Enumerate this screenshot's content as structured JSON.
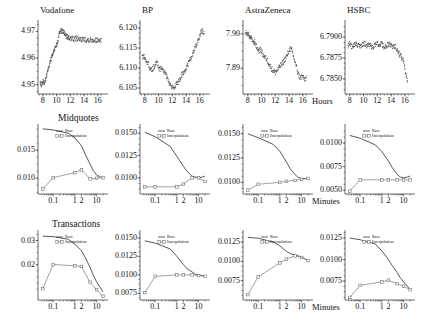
{
  "figure": {
    "rows": [
      {
        "row_title": "",
        "unit_label": "Hours"
      },
      {
        "row_title": "Midquotes",
        "unit_label": "Minutes"
      },
      {
        "row_title": "Transactions",
        "unit_label": "Minutes"
      }
    ],
    "legend": {
      "raw": "Raw",
      "interpolation": "Interpolation"
    }
  },
  "chart_data": [
    {
      "type": "line",
      "title": "Vodafone",
      "xlabel": "Hours",
      "ylabel": "",
      "xlim": [
        7.3,
        16.9
      ],
      "ylim": [
        4.9465,
        4.9735
      ],
      "xticks": [
        8,
        10,
        12,
        14,
        16
      ],
      "xticklabels": [
        "8",
        "10",
        "12",
        "14",
        "16"
      ],
      "yticks": [
        4.95,
        4.96,
        4.97
      ],
      "yticklabels": [
        "4.95",
        "4.96",
        "4.97"
      ],
      "grid": false,
      "series": [
        {
          "name": "price",
          "x": [
            7.6,
            7.8,
            8.0,
            8.2,
            8.4,
            8.6,
            8.8,
            9.0,
            9.2,
            9.4,
            9.6,
            9.8,
            10.0,
            10.2,
            10.4,
            10.6,
            10.8,
            11.0,
            11.2,
            11.4,
            11.6,
            11.8,
            12.0,
            12.3,
            12.6,
            12.9,
            13.2,
            13.5,
            13.8,
            14.1,
            14.4,
            14.7,
            15.0,
            15.3,
            15.6,
            15.9,
            16.2,
            16.5
          ],
          "y": [
            4.9505,
            4.95,
            4.9512,
            4.9508,
            4.9523,
            4.954,
            4.9565,
            4.958,
            4.9598,
            4.9612,
            4.9628,
            4.964,
            4.9652,
            4.9668,
            4.97,
            4.9703,
            4.9701,
            4.9698,
            4.969,
            4.9682,
            4.9678,
            4.9675,
            4.9674,
            4.9673,
            4.9672,
            4.9672,
            4.9671,
            4.9671,
            4.967,
            4.967,
            4.9669,
            4.9669,
            4.9669,
            4.9668,
            4.9668,
            4.9668,
            4.9668,
            4.9668
          ]
        }
      ]
    },
    {
      "type": "line",
      "title": "BP",
      "xlabel": "Hours",
      "ylabel": "",
      "xlim": [
        7.3,
        16.9
      ],
      "ylim": [
        6.1035,
        6.1215
      ],
      "xticks": [
        8,
        10,
        12,
        14,
        16
      ],
      "xticklabels": [
        "8",
        "10",
        "12",
        "14",
        "16"
      ],
      "yticks": [
        6.105,
        6.11,
        6.115,
        6.12
      ],
      "yticklabels": [
        "6.105",
        "6.110",
        "6.115",
        "6.120"
      ],
      "grid": false,
      "series": [
        {
          "name": "price",
          "x": [
            7.6,
            7.9,
            8.2,
            8.5,
            8.8,
            9.1,
            9.4,
            9.7,
            10.0,
            10.3,
            10.6,
            10.9,
            11.2,
            11.5,
            11.8,
            12.1,
            12.4,
            12.7,
            13.0,
            13.3,
            13.6,
            13.9,
            14.2,
            14.5,
            14.8,
            15.1,
            15.4,
            15.7,
            16.0,
            16.3,
            16.6
          ],
          "y": [
            6.1125,
            6.113,
            6.1118,
            6.111,
            6.1095,
            6.1098,
            6.1105,
            6.1118,
            6.11,
            6.1098,
            6.1096,
            6.109,
            6.1078,
            6.1062,
            6.1055,
            6.1052,
            6.1055,
            6.1062,
            6.107,
            6.1082,
            6.1088,
            6.1095,
            6.1105,
            6.1118,
            6.113,
            6.1142,
            6.1155,
            6.1168,
            6.1182,
            6.1195,
            6.1188
          ]
        }
      ]
    },
    {
      "type": "line",
      "title": "AstraZeneca",
      "xlabel": "Hours",
      "ylabel": "",
      "xlim": [
        7.3,
        16.9
      ],
      "ylim": [
        7.8825,
        7.9035
      ],
      "xticks": [
        8,
        10,
        12,
        14,
        16
      ],
      "xticklabels": [
        "8",
        "10",
        "12",
        "14",
        "16"
      ],
      "yticks": [
        7.89,
        7.9
      ],
      "yticklabels": [
        "7.89",
        "7.90"
      ],
      "grid": false,
      "series": [
        {
          "name": "price",
          "x": [
            7.6,
            7.9,
            8.1,
            8.3,
            8.5,
            8.8,
            9.0,
            9.3,
            9.6,
            9.9,
            10.2,
            10.5,
            10.8,
            11.1,
            11.4,
            11.7,
            12.0,
            12.3,
            12.6,
            12.9,
            13.2,
            13.5,
            13.8,
            14.1,
            14.4,
            14.7,
            15.0,
            15.3,
            15.6,
            15.9,
            16.2,
            16.5
          ],
          "y": [
            7.9005,
            7.8998,
            7.9002,
            7.8985,
            7.899,
            7.8972,
            7.8978,
            7.896,
            7.8952,
            7.8955,
            7.894,
            7.8932,
            7.8925,
            7.8912,
            7.89,
            7.8893,
            7.8888,
            7.8895,
            7.8905,
            7.8912,
            7.892,
            7.893,
            7.8942,
            7.8958,
            7.8952,
            7.893,
            7.8908,
            7.8885,
            7.8872,
            7.8878,
            7.8868,
            7.8872
          ]
        }
      ]
    },
    {
      "type": "line",
      "title": "HSBC",
      "xlabel": "Hours",
      "ylabel": "",
      "xlim": [
        7.3,
        16.9
      ],
      "ylim": [
        6.7832,
        6.7918
      ],
      "xticks": [
        8,
        10,
        12,
        14,
        16
      ],
      "xticklabels": [
        "8",
        "10",
        "12",
        "14",
        "16"
      ],
      "yticks": [
        6.785,
        6.7875,
        6.79
      ],
      "yticklabels": [
        "6.7850",
        "6.7875",
        "6.7900"
      ],
      "grid": false,
      "series": [
        {
          "name": "price",
          "x": [
            7.7,
            8.0,
            8.3,
            8.6,
            8.9,
            9.2,
            9.5,
            9.8,
            10.1,
            10.4,
            10.7,
            11.0,
            11.3,
            11.6,
            11.9,
            12.2,
            12.5,
            12.8,
            13.1,
            13.4,
            13.7,
            14.0,
            14.3,
            14.6,
            14.9,
            15.2,
            15.5,
            15.8,
            16.1,
            16.4
          ],
          "y": [
            6.789,
            6.7893,
            6.7888,
            6.789,
            6.7892,
            6.789,
            6.7888,
            6.789,
            6.7893,
            6.789,
            6.7892,
            6.789,
            6.7888,
            6.789,
            6.7892,
            6.789,
            6.7893,
            6.789,
            6.7888,
            6.789,
            6.7892,
            6.789,
            6.7888,
            6.789,
            6.7885,
            6.788,
            6.7876,
            6.7872,
            6.7858,
            6.7845
          ]
        }
      ]
    },
    {
      "type": "line",
      "title": "",
      "row": "Midquotes",
      "stock": "Vodafone",
      "xlabel": "Minutes",
      "xscale": "log",
      "xlim": [
        0.02,
        22
      ],
      "ylim": [
        0.0072,
        0.0193
      ],
      "xticks": [
        0.1,
        1,
        2,
        10
      ],
      "xticklabels": [
        "0.1",
        "1",
        "2",
        "10"
      ],
      "yticks": [
        0.01,
        0.015
      ],
      "yticklabels": [
        "0.010",
        "0.015"
      ],
      "grid": false,
      "series": [
        {
          "name": "Raw",
          "x": [
            0.0333,
            0.1,
            0.5,
            1,
            2,
            3,
            5,
            7,
            10,
            15,
            20
          ],
          "y": [
            0.0188,
            0.0186,
            0.018,
            0.0172,
            0.0158,
            0.0143,
            0.0125,
            0.0114,
            0.0106,
            0.0102,
            0.0101
          ]
        },
        {
          "name": "Interpolation",
          "x": [
            0.0333,
            0.1,
            1,
            2,
            5,
            10,
            20
          ],
          "y": [
            0.0081,
            0.0101,
            0.011,
            0.0115,
            0.0099,
            0.01,
            0.0101
          ]
        }
      ]
    },
    {
      "type": "line",
      "title": "",
      "row": "Midquotes",
      "stock": "BP",
      "xlabel": "Minutes",
      "xscale": "log",
      "xlim": [
        0.02,
        22
      ],
      "ylim": [
        0.0082,
        0.0158
      ],
      "xticks": [
        0.1,
        1,
        2,
        10
      ],
      "xticklabels": [
        "0.1",
        "1",
        "2",
        "10"
      ],
      "yticks": [
        0.01,
        0.0125,
        0.015
      ],
      "yticklabels": [
        "0.0100",
        "0.0125",
        "0.0150"
      ],
      "grid": false,
      "series": [
        {
          "name": "Raw",
          "x": [
            0.0333,
            0.1,
            0.5,
            1,
            2,
            3,
            5,
            7,
            10,
            15,
            20
          ],
          "y": [
            0.0151,
            0.0146,
            0.0135,
            0.0124,
            0.0113,
            0.0107,
            0.0102,
            0.0101,
            0.01,
            0.0101,
            0.0102
          ]
        },
        {
          "name": "Interpolation",
          "x": [
            0.0333,
            0.1,
            1,
            2,
            5,
            10,
            20
          ],
          "y": [
            0.009,
            0.009,
            0.009,
            0.0093,
            0.01,
            0.01,
            0.0096
          ]
        }
      ]
    },
    {
      "type": "line",
      "title": "",
      "row": "Midquotes",
      "stock": "AstraZeneca",
      "xlabel": "Minutes",
      "xscale": "log",
      "xlim": [
        0.02,
        22
      ],
      "ylim": [
        0.0088,
        0.0158
      ],
      "xticks": [
        0.1,
        1,
        2,
        10
      ],
      "xticklabels": [
        "0.1",
        "1",
        "2",
        "10"
      ],
      "yticks": [
        0.01,
        0.0125,
        0.015
      ],
      "yticklabels": [
        "0.0100",
        "0.0125",
        "0.0150"
      ],
      "grid": false,
      "series": [
        {
          "name": "Raw",
          "x": [
            0.0333,
            0.1,
            0.5,
            1,
            2,
            3,
            5,
            7,
            10,
            15,
            20
          ],
          "y": [
            0.015,
            0.0146,
            0.0139,
            0.0132,
            0.0121,
            0.0114,
            0.0108,
            0.0105,
            0.0104,
            0.0104,
            0.0105
          ]
        },
        {
          "name": "Interpolation",
          "x": [
            0.0333,
            0.1,
            1,
            2,
            5,
            10,
            20
          ],
          "y": [
            0.0092,
            0.0098,
            0.01,
            0.0101,
            0.0102,
            0.0103,
            0.0104
          ]
        }
      ]
    },
    {
      "type": "line",
      "title": "",
      "row": "Midquotes",
      "stock": "HSBC",
      "xlabel": "Minutes",
      "xscale": "log",
      "xlim": [
        0.02,
        22
      ],
      "ylim": [
        0.0046,
        0.0118
      ],
      "xticks": [
        0.1,
        1,
        2,
        10
      ],
      "xticklabels": [
        "0.1",
        "1",
        "2",
        "10"
      ],
      "yticks": [
        0.005,
        0.0075,
        0.01
      ],
      "yticklabels": [
        "0.0050",
        "0.0075",
        "0.0100"
      ],
      "grid": false,
      "series": [
        {
          "name": "Raw",
          "x": [
            0.0333,
            0.1,
            0.5,
            1,
            2,
            3,
            5,
            7,
            10,
            15,
            20
          ],
          "y": [
            0.0108,
            0.0105,
            0.0098,
            0.0091,
            0.0081,
            0.0074,
            0.0067,
            0.0064,
            0.0063,
            0.0064,
            0.0065
          ]
        },
        {
          "name": "Interpolation",
          "x": [
            0.0333,
            0.1,
            1,
            2,
            5,
            10,
            20
          ],
          "y": [
            0.0049,
            0.0061,
            0.0061,
            0.0061,
            0.0061,
            0.0061,
            0.0061
          ]
        }
      ]
    },
    {
      "type": "line",
      "title": "",
      "row": "Transactions",
      "stock": "Vodafone",
      "xlabel": "Minutes",
      "xscale": "log",
      "xlim": [
        0.02,
        22
      ],
      "ylim": [
        0.0055,
        0.0335
      ],
      "xticks": [
        0.1,
        1,
        2,
        10
      ],
      "xticklabels": [
        "0.1",
        "1",
        "2",
        "10"
      ],
      "yticks": [
        0.02,
        0.03
      ],
      "yticklabels": [
        "0.02",
        "0.03"
      ],
      "grid": false,
      "series": [
        {
          "name": "Raw",
          "x": [
            0.0333,
            0.1,
            0.5,
            1,
            2,
            3,
            5,
            7,
            10,
            15,
            20
          ],
          "y": [
            0.0318,
            0.0316,
            0.0305,
            0.0285,
            0.0258,
            0.023,
            0.019,
            0.0158,
            0.013,
            0.0105,
            0.0088
          ]
        },
        {
          "name": "Interpolation",
          "x": [
            0.0333,
            0.1,
            1,
            2,
            5,
            10,
            20
          ],
          "y": [
            0.0102,
            0.0201,
            0.0196,
            0.0193,
            0.0128,
            0.0098,
            0.007
          ]
        }
      ]
    },
    {
      "type": "line",
      "title": "",
      "row": "Transactions",
      "stock": "BP",
      "xlabel": "Minutes",
      "xscale": "log",
      "xlim": [
        0.02,
        22
      ],
      "ylim": [
        0.0066,
        0.0158
      ],
      "xticks": [
        0.1,
        1,
        2,
        10
      ],
      "xticklabels": [
        "0.1",
        "1",
        "2",
        "10"
      ],
      "yticks": [
        0.0075,
        0.01,
        0.0125,
        0.015
      ],
      "yticklabels": [
        "0.0075",
        "0.0100",
        "0.0125",
        "0.0150"
      ],
      "grid": false,
      "series": [
        {
          "name": "Raw",
          "x": [
            0.0333,
            0.1,
            0.5,
            1,
            2,
            3,
            5,
            7,
            10,
            15,
            20
          ],
          "y": [
            0.0146,
            0.0143,
            0.0135,
            0.0125,
            0.0114,
            0.0108,
            0.0104,
            0.0101,
            0.01,
            0.0099,
            0.0098
          ]
        },
        {
          "name": "Interpolation",
          "x": [
            0.0333,
            0.1,
            1,
            2,
            5,
            10,
            20
          ],
          "y": [
            0.0076,
            0.0098,
            0.01,
            0.01,
            0.01,
            0.0099,
            0.0098
          ]
        }
      ]
    },
    {
      "type": "line",
      "title": "",
      "row": "Transactions",
      "stock": "AstraZeneca",
      "xlabel": "Minutes",
      "xscale": "log",
      "xlim": [
        0.02,
        22
      ],
      "ylim": [
        0.005,
        0.0138
      ],
      "xticks": [
        0.1,
        1,
        2,
        10
      ],
      "xticklabels": [
        "0.1",
        "1",
        "2",
        "10"
      ],
      "yticks": [
        0.0075,
        0.01,
        0.0125
      ],
      "yticklabels": [
        "0.0075",
        "0.0100",
        "0.0125"
      ],
      "grid": false,
      "series": [
        {
          "name": "Raw",
          "x": [
            0.0333,
            0.1,
            0.5,
            1,
            2,
            3,
            5,
            7,
            10,
            15,
            20
          ],
          "y": [
            0.0131,
            0.013,
            0.0125,
            0.012,
            0.0113,
            0.011,
            0.0108,
            0.0107,
            0.0106,
            0.0103,
            0.0101
          ]
        },
        {
          "name": "Interpolation",
          "x": [
            0.0333,
            0.1,
            1,
            2,
            5,
            10,
            20
          ],
          "y": [
            0.0057,
            0.008,
            0.0098,
            0.0103,
            0.0107,
            0.0105,
            0.0101
          ]
        }
      ]
    },
    {
      "type": "line",
      "title": "",
      "row": "Transactions",
      "stock": "HSBC",
      "xlabel": "Minutes",
      "xscale": "log",
      "xlim": [
        0.02,
        22
      ],
      "ylim": [
        0.0053,
        0.0132
      ],
      "xticks": [
        0.1,
        1,
        2,
        10
      ],
      "xticklabels": [
        "0.1",
        "1",
        "2",
        "10"
      ],
      "yticks": [
        0.0075,
        0.01,
        0.0125
      ],
      "yticklabels": [
        "0.0075",
        "0.0100",
        "0.0125"
      ],
      "grid": false,
      "series": [
        {
          "name": "Raw",
          "x": [
            0.0333,
            0.1,
            0.5,
            1,
            2,
            3,
            5,
            7,
            10,
            15,
            20
          ],
          "y": [
            0.0125,
            0.0123,
            0.0118,
            0.011,
            0.01,
            0.0093,
            0.0085,
            0.0079,
            0.0074,
            0.0069,
            0.0065
          ]
        },
        {
          "name": "Interpolation",
          "x": [
            0.0333,
            0.1,
            1,
            2,
            5,
            10,
            20
          ],
          "y": [
            0.0056,
            0.007,
            0.0074,
            0.0076,
            0.0072,
            0.0069,
            0.0065
          ]
        }
      ]
    }
  ]
}
